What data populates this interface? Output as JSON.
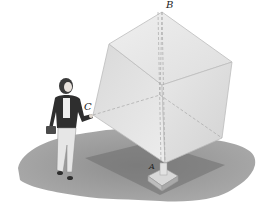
{
  "figure": {
    "labels": {
      "B": "B",
      "C": "C",
      "A": "A"
    },
    "colors": {
      "background": "#ffffff",
      "shadow": "#8c8c8c",
      "shadow_dark": "#6f6f6f",
      "cube_face_light": "#e6e6e6",
      "cube_face_mid": "#d4d4d4",
      "cube_edge": "#b9b9b9",
      "figure_dark": "#2e2e2e"
    }
  }
}
